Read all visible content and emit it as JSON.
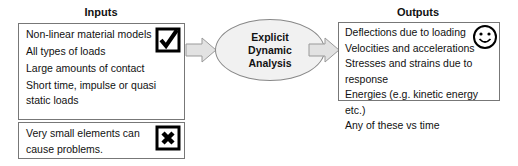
{
  "inputs": {
    "title": "Inputs",
    "items": [
      "Non-linear material models",
      "All types of loads",
      "Large amounts of contact",
      "Short time, impulse or quasi static loads"
    ],
    "icon": "checkbox-checked-icon"
  },
  "limitation": {
    "text": "Very small elements can cause problems.",
    "icon": "checkbox-x-icon"
  },
  "process": {
    "lines": [
      "Explicit",
      "Dynamic",
      "Analysis"
    ]
  },
  "outputs": {
    "title": "Outputs",
    "items": [
      "Deflections due to loading",
      "Velocities and accelerations",
      "Stresses and strains due to response",
      "Energies (e.g. kinetic energy etc.)",
      "Any of these vs time"
    ],
    "icon": "smiley-icon"
  }
}
